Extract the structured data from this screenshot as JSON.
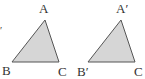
{
  "figures": [
    {
      "name": "triangle-ABC",
      "fill": "#d6d6d6",
      "stroke": "#555555",
      "vertices": {
        "A": {
          "x": 45,
          "y": 20
        },
        "B": {
          "x": 12,
          "y": 62
        },
        "C": {
          "x": 59,
          "y": 62
        }
      },
      "labels": {
        "A": "A",
        "B": "B",
        "C": "C"
      }
    },
    {
      "name": "triangle-A'B'C",
      "fill": "#d6d6d6",
      "stroke": "#555555",
      "vertices": {
        "A": {
          "x": 121,
          "y": 20
        },
        "B": {
          "x": 88,
          "y": 62
        },
        "C": {
          "x": 135,
          "y": 62
        }
      },
      "labels": {
        "A": "A′",
        "B": "B′",
        "C": "C"
      }
    }
  ],
  "stray_mark": "′"
}
